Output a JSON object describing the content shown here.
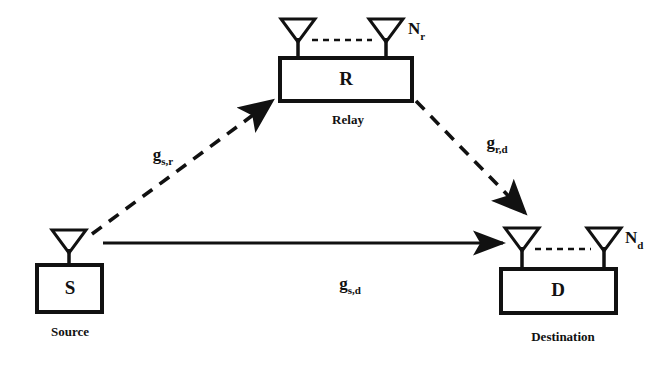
{
  "figure": {
    "background_color": "#ffffff",
    "stroke_color": "#111111"
  },
  "nodes": [
    {
      "id": "source",
      "symbol": "S",
      "caption": "Source",
      "antenna_count_label": "",
      "antenna_count_sub": "",
      "antennas": 1
    },
    {
      "id": "relay",
      "symbol": "R",
      "caption": "Relay",
      "antenna_count_label": "N",
      "antenna_count_sub": "r",
      "antennas": 2
    },
    {
      "id": "destination",
      "symbol": "D",
      "caption": "Destination",
      "antenna_count_label": "N",
      "antenna_count_sub": "d",
      "antennas": 2
    }
  ],
  "links": [
    {
      "id": "source-to-relay",
      "from": "source",
      "to": "relay",
      "style": "dashed",
      "arrow": true,
      "label": "g",
      "label_sub": "s,r"
    },
    {
      "id": "relay-to-destination",
      "from": "relay",
      "to": "destination",
      "style": "dashed",
      "arrow": true,
      "label": "g",
      "label_sub": "r,d"
    },
    {
      "id": "source-to-destination",
      "from": "source",
      "to": "destination",
      "style": "solid",
      "arrow": true,
      "label": "g",
      "label_sub": "s,d"
    }
  ]
}
